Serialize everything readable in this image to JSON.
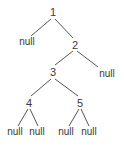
{
  "diagram": {
    "type": "binary-tree",
    "line_color": "#555555",
    "text_color": "#3a3a3a",
    "nodes": [
      {
        "id": "n1",
        "label": "1",
        "x": 53,
        "y": 12
      },
      {
        "id": "nL1",
        "label": "null",
        "x": 27,
        "y": 42
      },
      {
        "id": "n2",
        "label": "2",
        "x": 75,
        "y": 45
      },
      {
        "id": "n3",
        "label": "3",
        "x": 53,
        "y": 72
      },
      {
        "id": "nR2",
        "label": "null",
        "x": 107,
        "y": 74
      },
      {
        "id": "n4",
        "label": "4",
        "x": 29,
        "y": 103
      },
      {
        "id": "n5",
        "label": "5",
        "x": 80,
        "y": 103
      },
      {
        "id": "n4L",
        "label": "null",
        "x": 15,
        "y": 132
      },
      {
        "id": "n4R",
        "label": "null",
        "x": 37,
        "y": 132
      },
      {
        "id": "n5L",
        "label": "null",
        "x": 66,
        "y": 132
      },
      {
        "id": "n5R",
        "label": "null",
        "x": 89,
        "y": 132
      }
    ],
    "edges": [
      {
        "from": [
          51,
          19
        ],
        "to": [
          31,
          36
        ]
      },
      {
        "from": [
          55,
          19
        ],
        "to": [
          73,
          38
        ]
      },
      {
        "from": [
          73,
          51
        ],
        "to": [
          55,
          65
        ]
      },
      {
        "from": [
          77,
          51
        ],
        "to": [
          98,
          67
        ]
      },
      {
        "from": [
          51,
          79
        ],
        "to": [
          31,
          96
        ]
      },
      {
        "from": [
          55,
          79
        ],
        "to": [
          78,
          96
        ]
      },
      {
        "from": [
          28,
          109
        ],
        "to": [
          18,
          126
        ]
      },
      {
        "from": [
          30,
          109
        ],
        "to": [
          38,
          126
        ]
      },
      {
        "from": [
          79,
          109
        ],
        "to": [
          69,
          126
        ]
      },
      {
        "from": [
          81,
          109
        ],
        "to": [
          89,
          126
        ]
      }
    ]
  }
}
